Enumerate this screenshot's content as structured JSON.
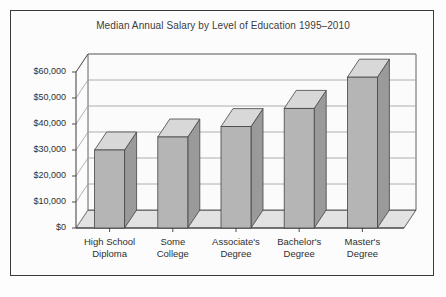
{
  "chart_data": {
    "type": "bar",
    "title": "Median Annual Salary by Level of Education 1995–2010",
    "xlabel": "",
    "ylabel": "",
    "categories": [
      "High School Diploma",
      "Some College",
      "Associate's Degree",
      "Bachelor's Degree",
      "Master's Degree"
    ],
    "category_lines": [
      [
        "High School",
        "Diploma"
      ],
      [
        "Some",
        "College"
      ],
      [
        "Associate's",
        "Degree"
      ],
      [
        "Bachelor's",
        "Degree"
      ],
      [
        "Master's",
        "Degree"
      ]
    ],
    "values": [
      30000,
      35000,
      39000,
      46000,
      58000
    ],
    "ylim": [
      0,
      60000
    ],
    "ytick_values": [
      0,
      10000,
      20000,
      30000,
      40000,
      50000,
      60000
    ],
    "ytick_labels": [
      "$0",
      "$10,000",
      "$20,000",
      "$30,000",
      "$40,000",
      "$50,000",
      "$60,000"
    ],
    "grid": true,
    "legend": false,
    "style": "3d-column",
    "colors": {
      "bar_front": "#b5b5b5",
      "bar_top": "#d8d8d8",
      "bar_side": "#9a9a9a",
      "bar_outline": "#444444",
      "floor": "#e2e2e2",
      "wall": "#fbfbfb",
      "gridline": "#9d9d9d",
      "axis": "#3a3a3a",
      "frame_border": "#3a3a3a",
      "page_background": "#fdfdfd",
      "text": "#2f2f2f"
    }
  }
}
